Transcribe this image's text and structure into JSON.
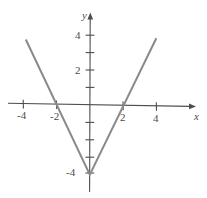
{
  "figure": {
    "background_color": "#ffffff",
    "curve_color": "#8a8a8a",
    "axis_color": "#4d4d4d",
    "label_color": "#4a4a4a",
    "width": 207,
    "height": 198
  },
  "axes": {
    "x_axis_name": "x",
    "y_axis_name": "y",
    "x_tick_labels": [
      "-4",
      "-2",
      "2",
      "4"
    ],
    "y_tick_labels": [
      "4",
      "2",
      "-4"
    ]
  },
  "chart_data": {
    "type": "line",
    "title": "",
    "xlabel": "x",
    "ylabel": "y",
    "xlim": [
      -5,
      6.3
    ],
    "ylim": [
      -5.3,
      5.3
    ],
    "grid": false,
    "legend": null,
    "x_ticks": [
      -4,
      -3,
      -2,
      -1,
      1,
      2,
      3,
      4,
      5
    ],
    "x_tick_labels_shown": {
      "-4": "-4",
      "-2": "-2",
      "2": "2",
      "4": "4"
    },
    "y_ticks": [
      4,
      3,
      2,
      1,
      -1,
      -2,
      -3,
      -4
    ],
    "y_tick_labels_shown": {
      "4": "4",
      "2": "2",
      "-4": "-4"
    },
    "equation": "y = 2|x| - 4",
    "vertex": [
      0,
      -4
    ],
    "x_intercepts": [
      -2,
      2
    ],
    "y_intercept": -4,
    "slopes": [
      -2,
      2
    ],
    "series": [
      {
        "name": "left-branch",
        "points": [
          [
            -3.85,
            3.7
          ],
          [
            0,
            -4
          ]
        ]
      },
      {
        "name": "right-branch",
        "points": [
          [
            0,
            -4
          ],
          [
            4.0,
            3.9
          ]
        ]
      }
    ]
  }
}
